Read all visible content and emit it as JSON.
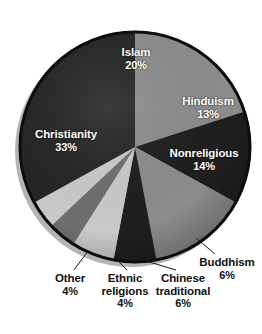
{
  "chart_data": {
    "type": "pie",
    "title": "",
    "subtitle": "",
    "xlabel": "",
    "ylabel": "",
    "legend_position": "none",
    "grid": false,
    "units": "percent",
    "total": 100,
    "start_angle_deg": 0,
    "direction": "clockwise",
    "categories": [
      "Islam",
      "Hinduism",
      "Nonreligious",
      "Buddhism",
      "Chinese traditional",
      "Ethnic religions",
      "Other",
      "Christianity"
    ],
    "values": [
      20,
      13,
      14,
      6,
      6,
      4,
      4,
      33
    ],
    "slices": [
      {
        "label": "Islam",
        "value": 20,
        "pct_text": "20%",
        "color": "#8c8c8c",
        "label_placement": "inside",
        "label_color": "#ffffff"
      },
      {
        "label": "Hinduism",
        "value": 13,
        "pct_text": "13%",
        "color": "#1f1f1f",
        "label_placement": "inside",
        "label_color": "#ffffff"
      },
      {
        "label": "Nonreligious",
        "value": 14,
        "pct_text": "14%",
        "color": "#8c8c8c",
        "label_placement": "inside",
        "label_color": "#ffffff"
      },
      {
        "label": "Buddhism",
        "value": 6,
        "pct_text": "6%",
        "color": "#1f1f1f",
        "label_placement": "outside",
        "label_color": "#111111"
      },
      {
        "label": "Chinese traditional",
        "value": 6,
        "pct_text": "6%",
        "color": "#c9c9c9",
        "label_placement": "outside",
        "label_color": "#111111"
      },
      {
        "label": "Ethnic religions",
        "value": 4,
        "pct_text": "4%",
        "color": "#6e6e6e",
        "label_placement": "outside",
        "label_color": "#111111"
      },
      {
        "label": "Other",
        "value": 4,
        "pct_text": "4%",
        "color": "#c9c9c9",
        "label_placement": "outside",
        "label_color": "#111111"
      },
      {
        "label": "Christianity",
        "value": 33,
        "pct_text": "33%",
        "color": "#262626",
        "label_placement": "inside",
        "label_color": "#ffffff"
      }
    ]
  },
  "labels": {
    "islam": {
      "name": "Islam",
      "pct": "20%"
    },
    "hinduism": {
      "name": "Hinduism",
      "pct": "13%"
    },
    "nonreligious": {
      "name": "Nonreligious",
      "pct": "14%"
    },
    "christianity": {
      "name": "Christianity",
      "pct": "33%"
    },
    "buddhism": {
      "name": "Buddhism",
      "pct": "6%"
    },
    "chinese": {
      "name": "Chinese traditional",
      "name_line1": "Chinese",
      "name_line2": "traditional",
      "pct": "6%"
    },
    "ethnic": {
      "name": "Ethnic religions",
      "name_line1": "Ethnic",
      "name_line2": "religions",
      "pct": "4%"
    },
    "other": {
      "name": "Other",
      "pct": "4%"
    }
  },
  "style": {
    "background": "#ffffff",
    "rim_color": "#000000",
    "shadow_color": "#b0b0b0",
    "leader_line_color": "#1a1a1a"
  }
}
